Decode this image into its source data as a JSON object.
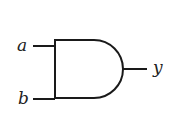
{
  "diagram": {
    "type": "logic-gate",
    "gate": "AND",
    "inputs": [
      {
        "label": "a"
      },
      {
        "label": "b"
      }
    ],
    "output": {
      "label": "y"
    },
    "colors": {
      "stroke": "#1a1a1a",
      "background": "#ffffff",
      "text": "#222222"
    }
  }
}
